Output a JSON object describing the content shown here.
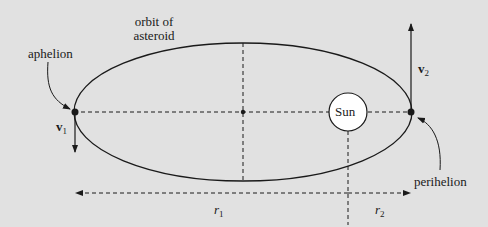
{
  "diagram": {
    "type": "orbit-diagram",
    "colors": {
      "background": "#e1e1e1",
      "stroke": "#1a1a1a",
      "sun_fill": "#ffffff"
    },
    "labels": {
      "orbit_line1": "orbit of",
      "orbit_line2": "asteroid",
      "aphelion": "aphelion",
      "perihelion": "perihelion",
      "sun": "Sun",
      "v1": "v",
      "v1_sub": "1",
      "v2": "v",
      "v2_sub": "2",
      "r1": "r",
      "r1_sub": "1",
      "r2": "r",
      "r2_sub": "2"
    }
  }
}
